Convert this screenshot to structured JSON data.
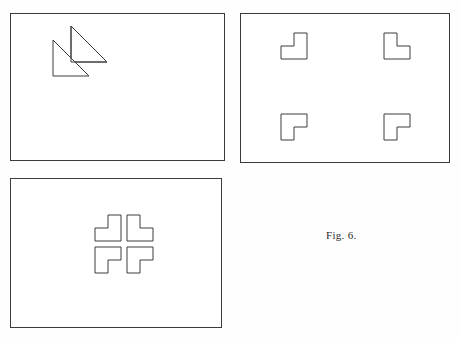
{
  "figure": {
    "caption": "Fig. 6.",
    "caption_position": {
      "x": 326,
      "y": 229
    },
    "background_color": "#fefefe",
    "line_color": "#3d3d3d",
    "fill_color": "#ffffff",
    "panel_border_color": "#3a3a3a"
  },
  "chart_data": {
    "type": "diagram",
    "title": "Fig. 6.",
    "panels": [
      {
        "id": "panel-1",
        "label": "overlapping-triangles-panel",
        "position": {
          "x": 10,
          "y": 13,
          "width": 215,
          "height": 148
        },
        "shapes": [
          {
            "name": "upper-right-triangle",
            "type": "triangle",
            "points": "60,12 60,48 96,48",
            "orientation": "right-angle-top-left"
          },
          {
            "name": "lower-left-triangle",
            "type": "triangle",
            "points": "42,26 42,62 78,62",
            "orientation": "right-angle-top-left"
          }
        ]
      },
      {
        "id": "panel-2",
        "label": "dispersed-l-shapes-panel",
        "position": {
          "x": 240,
          "y": 13,
          "width": 210,
          "height": 150
        },
        "shapes": [
          {
            "name": "l-shape-top-left",
            "type": "l-polygon",
            "rotation_deg": 90,
            "corner_facing": "bottom-right-inner",
            "points": "40,45 40,32 53,32 53,19 66,19 66,45",
            "center": {
              "x": 53,
              "y": 32
            }
          },
          {
            "name": "l-shape-top-right",
            "type": "l-polygon",
            "rotation_deg": 0,
            "corner_facing": "bottom-left-inner",
            "points": "143,19 156,19 156,32 169,32 169,45 143,45",
            "center": {
              "x": 156,
              "y": 32
            }
          },
          {
            "name": "l-shape-bottom-left",
            "type": "l-polygon",
            "rotation_deg": 180,
            "corner_facing": "top-right-inner",
            "points": "40,100 66,100 66,113 53,113 53,126 40,126",
            "center": {
              "x": 53,
              "y": 113
            }
          },
          {
            "name": "l-shape-bottom-right",
            "type": "l-polygon",
            "rotation_deg": 270,
            "corner_facing": "top-left-inner",
            "points": "143,100 169,100 169,113 156,113 156,126 143,126",
            "center": {
              "x": 156,
              "y": 113
            }
          }
        ]
      },
      {
        "id": "panel-3",
        "label": "grouped-l-shapes-illusory-cross-panel",
        "position": {
          "x": 10,
          "y": 178,
          "width": 212,
          "height": 150
        },
        "shapes": [
          {
            "name": "l-shape-top-left",
            "type": "l-polygon",
            "rotation_deg": 90,
            "corner_facing": "bottom-right-inner",
            "points": "84,62 84,49 97,49 97,36 110,36 110,62",
            "center": {
              "x": 97,
              "y": 49
            }
          },
          {
            "name": "l-shape-top-right",
            "type": "l-polygon",
            "rotation_deg": 0,
            "corner_facing": "bottom-left-inner",
            "points": "116,36 129,36 129,49 142,49 142,62 116,62",
            "center": {
              "x": 129,
              "y": 49
            }
          },
          {
            "name": "l-shape-bottom-left",
            "type": "l-polygon",
            "rotation_deg": 180,
            "corner_facing": "top-right-inner",
            "points": "84,68 110,68 110,81 97,81 97,94 84,94",
            "center": {
              "x": 97,
              "y": 81
            }
          },
          {
            "name": "l-shape-bottom-right",
            "type": "l-polygon",
            "rotation_deg": 270,
            "corner_facing": "top-left-inner",
            "points": "116,68 142,68 142,81 129,81 129,94 116,94",
            "center": {
              "x": 129,
              "y": 81
            }
          }
        ],
        "illusory_percept": "cross"
      }
    ]
  }
}
